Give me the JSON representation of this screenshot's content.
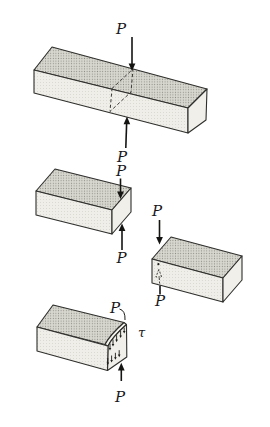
{
  "figure": {
    "kind": "mechanics-direct-shear-diagram",
    "colors": {
      "background": "#ffffff",
      "top_face_bg": "#d8d7cf",
      "top_face_dot": "#8f8e86",
      "front_face_bg": "#efeee8",
      "front_face_dot": "#c6c5bc",
      "end_face": "#f0efe9",
      "outline": "#2e2e2c",
      "arrow": "#141412"
    }
  },
  "labels": {
    "bar": {
      "top_force": "P",
      "bottom_force": "P"
    },
    "left_segment": {
      "top_force": "P",
      "shear_force": "P"
    },
    "right_segment": {
      "shear_force": "P",
      "bottom_force": "P"
    },
    "stress_block": {
      "edge_force": "P",
      "shear_stress": "τ",
      "reaction_force": "P"
    }
  }
}
